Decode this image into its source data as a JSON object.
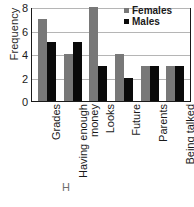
{
  "chart_data": {
    "type": "bar",
    "title": "",
    "xlabel": "",
    "ylabel": "Frequency",
    "ylim": [
      0,
      8
    ],
    "yticks": [
      0,
      2,
      4,
      6,
      8
    ],
    "grid": true,
    "legend_position": "top-right",
    "categories": [
      "Grades",
      "Having enough money",
      "Looks",
      "Future",
      "Parents",
      "Being talked about"
    ],
    "category_lines": [
      [
        "Grades",
        ""
      ],
      [
        "Having enough",
        "money"
      ],
      [
        "Looks",
        ""
      ],
      [
        "Future",
        ""
      ],
      [
        "Parents",
        ""
      ],
      [
        "Being talked",
        "about"
      ]
    ],
    "series": [
      {
        "name": "Females",
        "color": "#787878",
        "values": [
          7,
          4,
          8,
          4,
          3,
          3
        ]
      },
      {
        "name": "Males",
        "color": "#0a0a0a",
        "values": [
          5,
          5,
          3,
          2,
          3,
          3
        ]
      }
    ]
  },
  "legend": {
    "entries": [
      {
        "label": "Females"
      },
      {
        "label": "Males"
      }
    ]
  },
  "axis": {
    "y_title": "Frequency",
    "y_tick_labels": [
      "0",
      "2",
      "4",
      "6",
      "8"
    ]
  },
  "artifacts": {
    "top_fragment": "",
    "bottom_fragment": "H"
  }
}
